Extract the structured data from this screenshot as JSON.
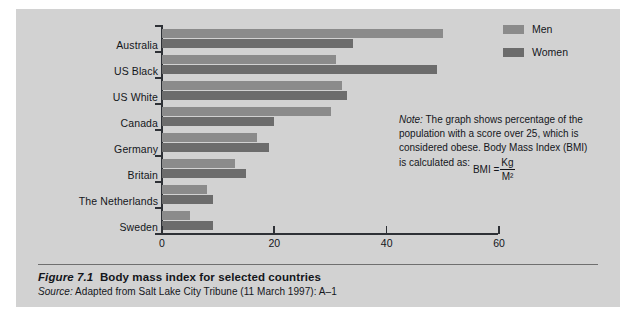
{
  "chart_data": {
    "type": "bar",
    "orientation": "horizontal",
    "title": "Body mass index for selected countries",
    "xlabel": "",
    "ylabel": "",
    "xlim": [
      0,
      60
    ],
    "xticks": [
      0,
      20,
      40,
      60
    ],
    "xtick_labels": [
      "0",
      "20",
      "40",
      "60"
    ],
    "grid": false,
    "legend_position": "top-right",
    "categories": [
      "Australia",
      "US Black",
      "US White",
      "Canada",
      "Germany",
      "Britain",
      "The Netherlands",
      "Sweden"
    ],
    "series": [
      {
        "name": "Men",
        "color": "#8b8b8b",
        "values": [
          50,
          31,
          32,
          30,
          17,
          13,
          8,
          5
        ]
      },
      {
        "name": "Women",
        "color": "#6c6c6c",
        "values": [
          34,
          49,
          33,
          20,
          19,
          15,
          9,
          9
        ]
      }
    ]
  },
  "legend": {
    "items": [
      {
        "label": "Men",
        "color": "#8b8b8b"
      },
      {
        "label": "Women",
        "color": "#6c6c6c"
      }
    ]
  },
  "note": {
    "lead": "Note:",
    "body": " The graph shows percentage of the population with a score over 25, which is considered obese. Body Mass Index (BMI) is calculated as:",
    "formula_label": "BMI =",
    "formula_numerator": "Kg",
    "formula_denominator": "M²"
  },
  "caption": {
    "figure_number": "Figure 7.1",
    "figure_title": "Body mass index for selected countries",
    "source_lead": "Source:",
    "source_text": " Adapted from Salt Lake City Tribune (11 March 1997): A–1"
  },
  "colors": {
    "panel_background": "#d2d2d2",
    "axis": "#2e3136",
    "text": "#14161b",
    "men": "#8b8b8b",
    "women": "#6c6c6c"
  }
}
